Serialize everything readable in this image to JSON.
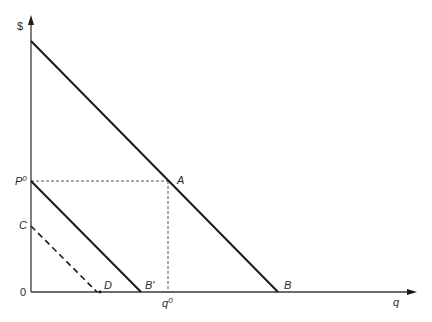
{
  "diagram": {
    "type": "economics-demand-diagram",
    "axes": {
      "y_label": "$",
      "x_label": "q",
      "origin_label": "0"
    },
    "points": {
      "A": {
        "label": "A"
      },
      "B": {
        "label": "B"
      },
      "B_prime": {
        "label": "B'"
      },
      "C": {
        "label": "C"
      },
      "D": {
        "label": "D"
      },
      "P0": {
        "label": "P",
        "sup": "0"
      },
      "q0": {
        "label": "q",
        "sup": "0"
      }
    },
    "lines": [
      {
        "name": "demand-line-AB",
        "style": "solid",
        "from": "top of $ axis",
        "to": "B"
      },
      {
        "name": "demand-line-P0B-prime",
        "style": "solid",
        "from": "P0",
        "to": "B'"
      },
      {
        "name": "demand-line-CD",
        "style": "dashed",
        "from": "C",
        "to": "D"
      },
      {
        "name": "price-guide-P0-A",
        "style": "dotted",
        "from": "P0",
        "to": "A"
      },
      {
        "name": "quantity-guide-A-q0",
        "style": "dotted",
        "from": "A",
        "to": "q0"
      }
    ],
    "colors": {
      "line": "#1a1a1a",
      "axis": "#3a3a3a",
      "text": "#2a2a2a"
    }
  }
}
